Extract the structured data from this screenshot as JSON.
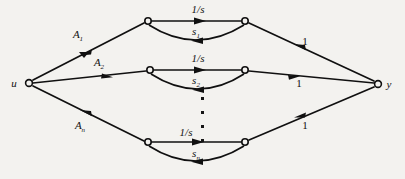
{
  "figure": {
    "type": "signal-flow-graph",
    "title": "",
    "background_color": "#f3f2ef",
    "ink_color": "#101010"
  },
  "nodes": {
    "input": {
      "label": "u",
      "x": 28,
      "y": 82
    },
    "output": {
      "label": "y",
      "x": 379,
      "y": 84
    },
    "branches": [
      {
        "left_x": 148,
        "left_y": 21,
        "right_x": 245,
        "right_y": 21
      },
      {
        "left_x": 150,
        "left_y": 70,
        "right_x": 245,
        "right_y": 70
      },
      {
        "left_x": 148,
        "left_y": 142,
        "right_x": 245,
        "right_y": 142
      }
    ]
  },
  "branch_rows": [
    {
      "input_gain": "A",
      "input_gain_sub": "1",
      "forward_gain": "1/s",
      "feedback_gain": "s",
      "feedback_gain_sub": "1",
      "output_gain": "1"
    },
    {
      "input_gain": "A",
      "input_gain_sub": "2",
      "forward_gain": "1/s",
      "feedback_gain": "s",
      "feedback_gain_sub": "2",
      "output_gain": "1"
    },
    {
      "input_gain": "A",
      "input_gain_sub": "n",
      "forward_gain": "1/s",
      "feedback_gain": "s",
      "feedback_gain_sub": "n",
      "output_gain": "1"
    }
  ],
  "ellipsis": {
    "glyph": "·",
    "count": 4,
    "x": 203,
    "y_start": 98,
    "y_step": 14
  },
  "label_positions": {
    "A1": {
      "x": 78,
      "y": 38
    },
    "A2": {
      "x": 98,
      "y": 66
    },
    "An": {
      "x": 80,
      "y": 128
    },
    "fwd1": {
      "x": 198,
      "y": 13
    },
    "fwd2": {
      "x": 198,
      "y": 62
    },
    "fwd3": {
      "x": 186,
      "y": 136
    },
    "fb1": {
      "x": 196,
      "y": 35
    },
    "fb2": {
      "x": 196,
      "y": 84
    },
    "fb3": {
      "x": 196,
      "y": 157
    },
    "out1": {
      "x": 305,
      "y": 45
    },
    "out2": {
      "x": 300,
      "y": 86
    },
    "out3": {
      "x": 305,
      "y": 128
    },
    "u": {
      "x": 14,
      "y": 86
    },
    "y": {
      "x": 388,
      "y": 88
    }
  }
}
